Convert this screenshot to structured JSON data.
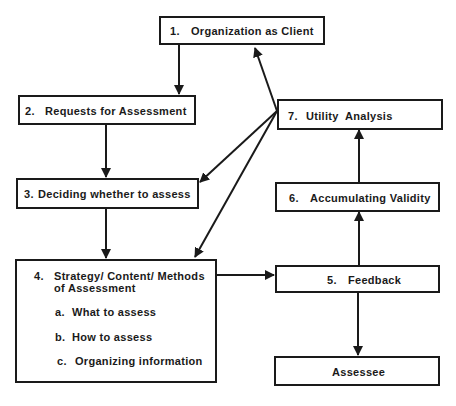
{
  "diagram": {
    "nodes": {
      "n1": {
        "number": "1.",
        "label": "Organization as Client"
      },
      "n2": {
        "number": "2.",
        "label": "Requests for Assessment"
      },
      "n3": {
        "number": "3.",
        "label": "Deciding whether to assess"
      },
      "n4": {
        "number": "4.",
        "label_line1": "Strategy/ Content/ Methods",
        "label_line2": "of Assessment",
        "subitems": [
          {
            "marker": "a.",
            "label": "What to assess"
          },
          {
            "marker": "b.",
            "label": "How to assess"
          },
          {
            "marker": "c.",
            "label": "Organizing information"
          }
        ]
      },
      "n5": {
        "number": "5.",
        "label": "Feedback"
      },
      "n6": {
        "number": "6.",
        "label": "Accumulating Validity"
      },
      "n7": {
        "number": "7.",
        "label": "Utility  Analysis"
      },
      "assessee": {
        "label": "Assessee"
      }
    },
    "edges": [
      {
        "from": "1",
        "to": "2"
      },
      {
        "from": "2",
        "to": "3"
      },
      {
        "from": "3",
        "to": "4"
      },
      {
        "from": "4",
        "to": "5"
      },
      {
        "from": "5",
        "to": "Assessee"
      },
      {
        "from": "5",
        "to": "6"
      },
      {
        "from": "6",
        "to": "7"
      },
      {
        "from": "7",
        "to": "1"
      },
      {
        "from": "7",
        "to": "3"
      },
      {
        "from": "7",
        "to": "4"
      }
    ],
    "colors": {
      "line": "#1a1a1a",
      "background": "#ffffff"
    }
  }
}
